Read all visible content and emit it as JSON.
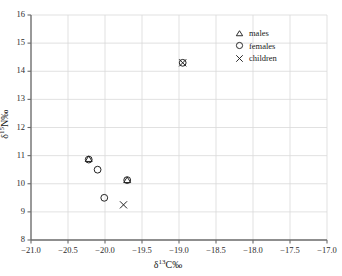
{
  "chart_data": {
    "type": "scatter",
    "title": "",
    "xlabel": "δ¹³C‰",
    "ylabel": "δ¹⁵N‰",
    "xlim": [
      -21.0,
      -17.0
    ],
    "ylim": [
      8,
      16
    ],
    "xticks": [
      -21.0,
      -20.5,
      -20.0,
      -19.5,
      -19.0,
      -18.5,
      -18.0,
      -17.5,
      -17.0
    ],
    "xtick_labels": [
      "−21.0",
      "−20.5",
      "−20.0",
      "−19.5",
      "−19.0",
      "−18.5",
      "−18.0",
      "−17.5",
      "−17.0"
    ],
    "yticks": [
      8,
      9,
      10,
      11,
      12,
      13,
      14,
      15,
      16
    ],
    "ytick_labels": [
      "8",
      "9",
      "10",
      "11",
      "12",
      "13",
      "14",
      "15",
      "16"
    ],
    "grid": true,
    "legend_position": "top-right",
    "series": [
      {
        "name": "males",
        "marker": "triangle",
        "points": [
          {
            "x": -20.22,
            "y": 10.88
          },
          {
            "x": -19.7,
            "y": 10.13
          }
        ]
      },
      {
        "name": "females",
        "marker": "circle",
        "points": [
          {
            "x": -20.22,
            "y": 10.86
          },
          {
            "x": -20.1,
            "y": 10.5
          },
          {
            "x": -19.7,
            "y": 10.13
          },
          {
            "x": -20.01,
            "y": 9.5
          },
          {
            "x": -18.95,
            "y": 14.3
          }
        ]
      },
      {
        "name": "children",
        "marker": "cross",
        "points": [
          {
            "x": -19.75,
            "y": 9.25
          },
          {
            "x": -18.95,
            "y": 14.3
          }
        ]
      }
    ]
  },
  "legend": {
    "items": [
      {
        "label": "males",
        "symbol": "triangle"
      },
      {
        "label": "females",
        "symbol": "circle"
      },
      {
        "label": "children",
        "symbol": "cross"
      }
    ]
  },
  "axes": {
    "x_title": "δ¹³C‰",
    "y_title": "δ¹⁵N‰",
    "x_title_base": "δ",
    "x_title_sup": "13",
    "x_title_tail": "C‰",
    "y_title_base": "δ",
    "y_title_sup": "15",
    "y_title_tail": "N‰"
  },
  "colors": {
    "axis": "#6a6a6a",
    "grid": "#d9d9d9",
    "marker": "#222222",
    "text": "#1a1a1a"
  }
}
